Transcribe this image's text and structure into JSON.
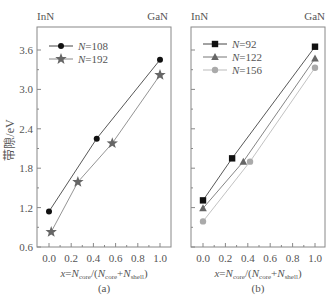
{
  "figure": {
    "ylabel": "带隙/eV",
    "colors": {
      "axis": "#777777",
      "text": "#555555"
    }
  },
  "chart_data": [
    {
      "panel": "(a)",
      "type": "line",
      "top_left_label": "InN",
      "top_right_label": "GaN",
      "xlabel": "x=N_core/(N_core+N_shell)",
      "ylabel": "带隙/eV",
      "xlim": [
        -0.05,
        1.05
      ],
      "ylim": [
        0.6,
        4.2
      ],
      "xticks": [
        "0.0",
        "0.2",
        "0.4",
        "0.6",
        "0.8",
        "1.0"
      ],
      "yticks": [
        "0.6",
        "1.2",
        "1.8",
        "2.4",
        "3.0",
        "3.6"
      ],
      "grid": false,
      "legend_position": "upper left",
      "series": [
        {
          "name": "N=108",
          "marker": "diamond",
          "color": "#111111",
          "line_color": "#444444",
          "x": [
            0.0,
            0.43,
            1.0
          ],
          "y": [
            1.14,
            2.25,
            3.45
          ]
        },
        {
          "name": "N=192",
          "marker": "star",
          "color": "#666666",
          "line_color": "#888888",
          "x": [
            0.02,
            0.26,
            0.57,
            1.0
          ],
          "y": [
            0.83,
            1.59,
            2.18,
            3.22
          ]
        }
      ]
    },
    {
      "panel": "(b)",
      "type": "line",
      "top_left_label": "InN",
      "top_right_label": "GaN",
      "xlabel": "x=N_core/(N_core+N_shell)",
      "ylabel": "",
      "xlim": [
        -0.1,
        1.1
      ],
      "ylim": [
        0.6,
        4.2
      ],
      "xticks": [
        "0.0",
        "0.2",
        "0.4",
        "0.6",
        "0.8",
        "1.0"
      ],
      "yticks": [],
      "grid": false,
      "legend_position": "upper left",
      "series": [
        {
          "name": "N=92",
          "marker": "square",
          "color": "#111111",
          "line_color": "#444444",
          "x": [
            0.0,
            0.26,
            1.0
          ],
          "y": [
            1.31,
            1.95,
            3.65
          ]
        },
        {
          "name": "N=122",
          "marker": "triangle",
          "color": "#666666",
          "line_color": "#777777",
          "x": [
            0.0,
            0.36,
            1.0
          ],
          "y": [
            1.19,
            1.9,
            3.47
          ]
        },
        {
          "name": "N=156",
          "marker": "circle",
          "color": "#aaaaaa",
          "line_color": "#bbbbbb",
          "x": [
            0.0,
            0.42,
            1.0
          ],
          "y": [
            0.99,
            1.9,
            3.33
          ]
        }
      ]
    }
  ]
}
